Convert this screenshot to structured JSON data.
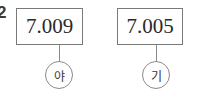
{
  "question_number": "2",
  "items": [
    {
      "value": "7.009",
      "label": "야"
    },
    {
      "value": "7.005",
      "label": "기"
    }
  ]
}
